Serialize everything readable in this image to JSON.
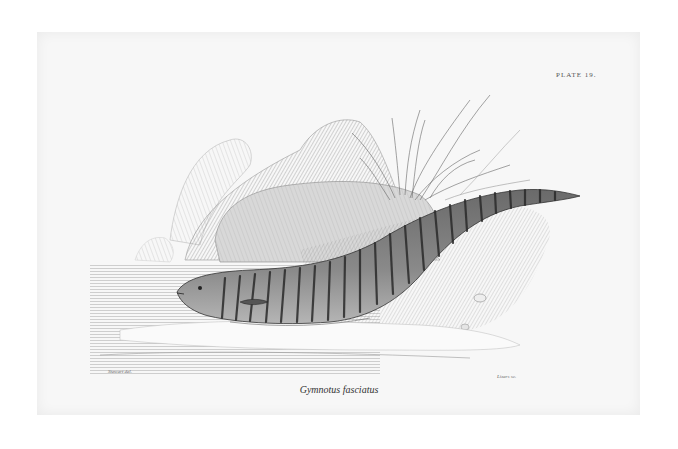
{
  "plate": {
    "number_label": "PLATE 19.",
    "caption": "Gymnotus fasciatus",
    "credit_left": "Stewart del.",
    "credit_right": "Lizars sc."
  },
  "illustration": {
    "subject": "banded knifefish (eel-like fish) lying on a sandy bank beside water",
    "elements": [
      "fish",
      "rocks",
      "grass-tuft",
      "water",
      "shore"
    ]
  }
}
